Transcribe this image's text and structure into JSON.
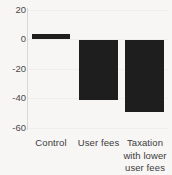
{
  "chart_data": {
    "type": "bar",
    "title": "",
    "subtitle": "",
    "xlabel": "",
    "ylabel": "",
    "categories": [
      "Control",
      "User fees",
      "Taxation with lower user fees"
    ],
    "category_lines": [
      [
        "Control"
      ],
      [
        "User fees"
      ],
      [
        "Taxation",
        "with lower",
        "user fees"
      ]
    ],
    "values": [
      4,
      -41,
      -49
    ],
    "series": [
      {
        "name": "",
        "values": [
          4,
          -41,
          -49
        ]
      }
    ],
    "ylim": [
      -60,
      20
    ],
    "yticks": [
      20,
      0,
      -20,
      -40,
      -60
    ],
    "ytick_labels": [
      "20",
      "0",
      "-20",
      "-40",
      "-60"
    ],
    "grid": true,
    "legend": false,
    "legend_position": "none",
    "bar_color": "#1e1e1e",
    "background_color": "#f7f6f4",
    "axis_color": "#d9d7d3",
    "gridline_color": "#efeeec",
    "tick_label_color": "#4a4a4a",
    "annotations": []
  },
  "axis": {
    "y_tick_0": "20",
    "y_tick_1": "0",
    "y_tick_2": "-20",
    "y_tick_3": "-40",
    "y_tick_4": "-60"
  }
}
